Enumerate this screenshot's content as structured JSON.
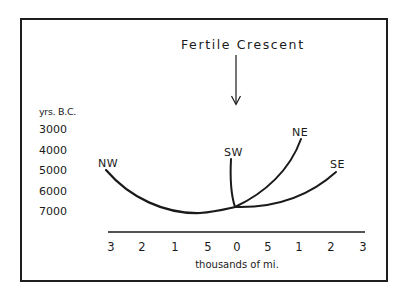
{
  "diagram": {
    "title": "Fertile Crescent",
    "arrow": "down-arrow",
    "y_axis": {
      "header": "yrs. B.C.",
      "labels": [
        "3000",
        "4000",
        "5000",
        "6000",
        "7000"
      ]
    },
    "x_axis": {
      "ticks": [
        "3",
        "2",
        "1",
        "5",
        "0",
        "5",
        "1",
        "2",
        "3"
      ],
      "label": "thousands of mi."
    },
    "branches": [
      {
        "name": "NW",
        "label": "NW"
      },
      {
        "name": "SW",
        "label": "SW"
      },
      {
        "name": "NE",
        "label": "NE"
      },
      {
        "name": "SE",
        "label": "SE"
      }
    ],
    "colors": {
      "ink": "#1a1a1a",
      "background": "#ffffff"
    }
  }
}
